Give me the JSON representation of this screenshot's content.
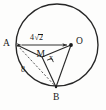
{
  "figure": {
    "type": "geometry-diagram",
    "colors": {
      "stroke": "#262626",
      "dashed_stroke": "#555555",
      "background": "#fdfdfc",
      "text": "#1a1a1a"
    },
    "circle": {
      "center_label": "O",
      "cx": 57,
      "cy": 45,
      "r": 41
    },
    "points": [
      {
        "id": "A",
        "label": "A",
        "x": 17,
        "y": 45,
        "label_x": 4,
        "label_y": 40,
        "dot": false
      },
      {
        "id": "O",
        "label": "O",
        "x": 71,
        "y": 45,
        "label_x": 77,
        "label_y": 38,
        "dot": true
      },
      {
        "id": "B",
        "label": "B",
        "x": 56,
        "y": 87,
        "label_x": 53,
        "label_y": 94,
        "dot": false
      },
      {
        "id": "M",
        "label": "M",
        "x": 42,
        "y": 57,
        "label_x": 37,
        "label_y": 52,
        "dot": false
      }
    ],
    "segments": [
      {
        "id": "AO",
        "from": "A",
        "to": "O",
        "style": "arrow-both",
        "label": "4√2"
      },
      {
        "id": "AB",
        "from": "A",
        "to": "B",
        "style": "dashed",
        "label": "8"
      },
      {
        "id": "OB",
        "from": "O",
        "to": "B",
        "style": "solid",
        "label": ""
      },
      {
        "id": "AM",
        "from": "A",
        "to": "M",
        "style": "solid",
        "label": ""
      },
      {
        "id": "MB",
        "from": "M",
        "to": "B",
        "style": "solid",
        "label": ""
      },
      {
        "id": "MO",
        "from": "M",
        "to": "O",
        "style": "solid",
        "label": "x"
      }
    ],
    "labels": {
      "point_a": "A",
      "point_o": "O",
      "point_b": "B",
      "point_m": "M",
      "seg_ao_number": "4",
      "seg_ao_radical": "2",
      "seg_ab": "8",
      "seg_mo": "x"
    },
    "right_angle": {
      "at": "M",
      "between": [
        "MB",
        "MO"
      ],
      "marker": "square"
    }
  }
}
